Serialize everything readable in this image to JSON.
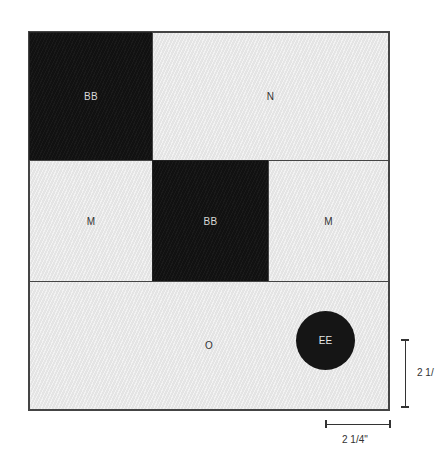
{
  "diagram": {
    "title": "",
    "colors": {
      "dark": "#111111",
      "light": "#ebebeb",
      "outline": "#444444"
    },
    "blocks": [
      {
        "id": "top-left",
        "label": "BB",
        "tone": "dark"
      },
      {
        "id": "top-right",
        "label": "N",
        "tone": "light"
      },
      {
        "id": "middle-left",
        "label": "M",
        "tone": "light"
      },
      {
        "id": "middle-center",
        "label": "BB",
        "tone": "dark"
      },
      {
        "id": "middle-right",
        "label": "M",
        "tone": "light"
      },
      {
        "id": "bottom",
        "label": "O",
        "tone": "light"
      }
    ],
    "circle": {
      "label": "EE",
      "tone": "dark"
    },
    "dimensions": {
      "vertical": {
        "label": "2 1/"
      },
      "horizontal": {
        "label": "2 1/4\""
      }
    }
  }
}
